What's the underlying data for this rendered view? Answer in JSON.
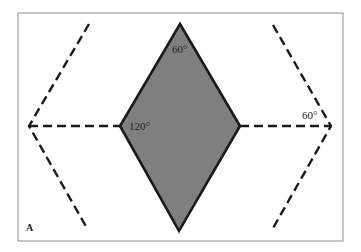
{
  "figure": {
    "panel_label": "A",
    "angles": {
      "top": "60°",
      "left": "120°",
      "right": "60°"
    },
    "colors": {
      "fill": "#7f7f7f",
      "stroke": "#1a1a1a",
      "border": "#8c8c8c"
    }
  }
}
